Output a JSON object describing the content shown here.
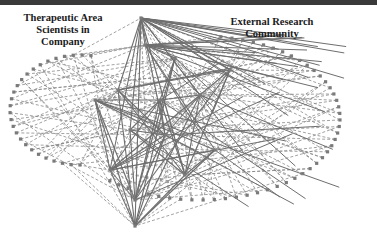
{
  "diagram": {
    "labels": {
      "internal": "Therapeutic Area\nScientists in\nCompany",
      "external": "External Research\nCommunity"
    },
    "colors": {
      "top_bar": "#3a3a3a",
      "solid_edge": "#6e6e6e",
      "dashed_edge": "#8a8a8a",
      "node": "#7a7a7a",
      "background": "#ffffff"
    },
    "legend_of_edges": {
      "solid": "internal collaboration links",
      "dashed": "links to external research community"
    }
  }
}
